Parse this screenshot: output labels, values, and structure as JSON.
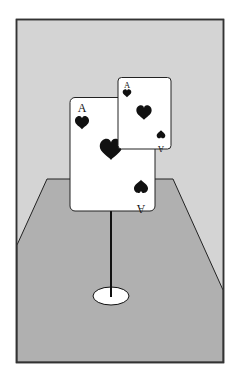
{
  "scene": {
    "description": "Two playing cards mounted on a pole above a floor",
    "colors": {
      "page_bg": "#ffffff",
      "wall": "#d4d4d4",
      "floor": "#b0b0b0",
      "frame": "#333333",
      "card": "#ffffff",
      "suit": "#111111",
      "base": "#ffffff"
    }
  },
  "cards": {
    "large": {
      "rank": "A",
      "suit": "heart",
      "rank_inverted": "A"
    },
    "small": {
      "rank": "A",
      "suit": "heart",
      "rank_inverted": "A"
    }
  }
}
